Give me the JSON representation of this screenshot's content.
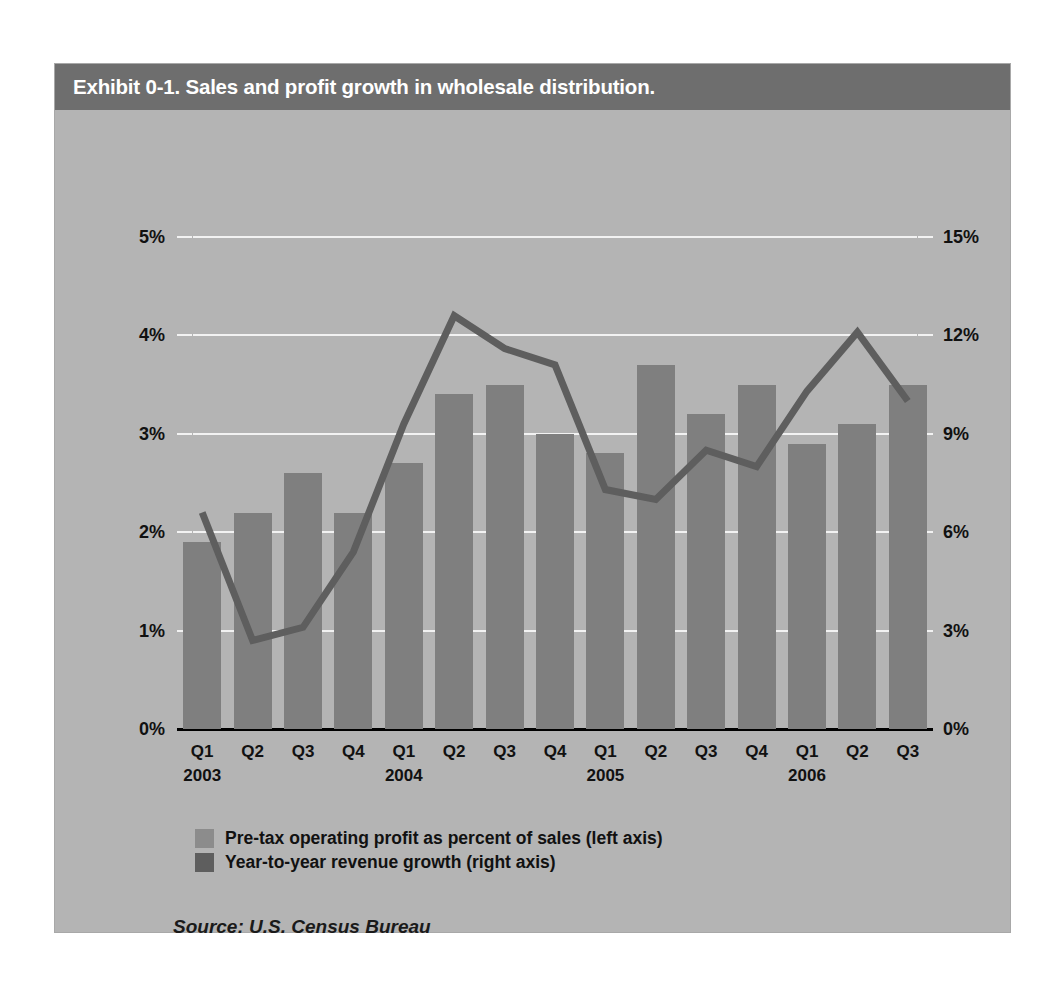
{
  "exhibit": {
    "title": "Exhibit 0-1. Sales and profit growth in wholesale distribution.",
    "source": "Source: U.S. Census Bureau"
  },
  "legend": {
    "items": [
      {
        "label": "Pre-tax operating profit as percent of sales (left axis)",
        "color": "#8c8c8c"
      },
      {
        "label": "Year-to-year revenue growth (right axis)",
        "color": "#5e5e5e"
      }
    ]
  },
  "colors": {
    "panel_background": "#b4b4b4",
    "title_bar": "#6e6e6e",
    "bar": "#7f7f7f",
    "line": "#5e5e5e",
    "gridline": "#f2f2f2",
    "axis": "#000000"
  },
  "chart_data": {
    "type": "bar",
    "title": "Exhibit 0-1. Sales and profit growth in wholesale distribution.",
    "xlabel": "",
    "ylabel": "",
    "grid": true,
    "legend_position": "bottom-left",
    "categories": [
      "Q1",
      "Q2",
      "Q3",
      "Q4",
      "Q1",
      "Q2",
      "Q3",
      "Q4",
      "Q1",
      "Q2",
      "Q3",
      "Q4",
      "Q1",
      "Q2",
      "Q3"
    ],
    "year_labels": [
      {
        "label": "2003",
        "at_index": 0
      },
      {
        "label": "2004",
        "at_index": 4
      },
      {
        "label": "2005",
        "at_index": 8
      },
      {
        "label": "2006",
        "at_index": 12
      }
    ],
    "left_axis": {
      "ticks": [
        "0%",
        "1%",
        "2%",
        "3%",
        "4%",
        "5%"
      ],
      "values": [
        0,
        1,
        2,
        3,
        4,
        5
      ],
      "ylim": [
        0,
        5
      ]
    },
    "right_axis": {
      "ticks": [
        "0%",
        "3%",
        "6%",
        "9%",
        "12%",
        "15%"
      ],
      "values": [
        0,
        3,
        6,
        9,
        12,
        15
      ],
      "ylim": [
        0,
        15
      ]
    },
    "series": [
      {
        "name": "Pre-tax operating profit as percent of sales (left axis)",
        "type": "bar",
        "axis": "left",
        "color": "#7f7f7f",
        "values": [
          1.9,
          2.2,
          2.6,
          2.2,
          2.7,
          3.4,
          3.5,
          3.0,
          2.8,
          3.7,
          3.2,
          3.5,
          2.9,
          3.1,
          3.5
        ]
      },
      {
        "name": "Year-to-year revenue growth (right axis)",
        "type": "line",
        "axis": "right",
        "color": "#5e5e5e",
        "values": [
          6.6,
          2.7,
          3.1,
          5.4,
          9.3,
          12.6,
          11.6,
          11.1,
          7.3,
          7.0,
          8.5,
          8.0,
          10.3,
          12.1,
          10.0
        ]
      }
    ]
  }
}
